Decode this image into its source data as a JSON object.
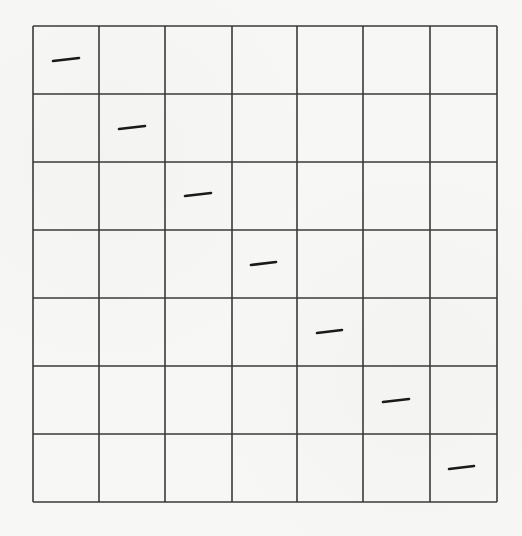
{
  "diagram": {
    "type": "grid",
    "rows": 7,
    "cols": 7,
    "origin": {
      "x": 33,
      "y": 26
    },
    "col_lines_x": [
      33,
      99,
      165,
      232,
      297,
      363,
      430,
      497
    ],
    "row_lines_y": [
      26,
      94,
      162,
      230,
      298,
      366,
      434,
      502
    ],
    "line_color": "#3a3a3a",
    "mark_color": "#1a1a1a",
    "background_color": "#f7f7f5",
    "marks": [
      {
        "row": 0,
        "col": 0,
        "x1": 53,
        "y1": 61,
        "x2": 79,
        "y2": 58
      },
      {
        "row": 1,
        "col": 1,
        "x1": 119,
        "y1": 129,
        "x2": 145,
        "y2": 126
      },
      {
        "row": 2,
        "col": 2,
        "x1": 185,
        "y1": 196,
        "x2": 211,
        "y2": 193
      },
      {
        "row": 3,
        "col": 3,
        "x1": 251,
        "y1": 265,
        "x2": 276,
        "y2": 262
      },
      {
        "row": 4,
        "col": 4,
        "x1": 317,
        "y1": 333,
        "x2": 342,
        "y2": 330
      },
      {
        "row": 5,
        "col": 5,
        "x1": 383,
        "y1": 402,
        "x2": 409,
        "y2": 399
      },
      {
        "row": 6,
        "col": 6,
        "x1": 449,
        "y1": 469,
        "x2": 474,
        "y2": 466
      }
    ]
  }
}
